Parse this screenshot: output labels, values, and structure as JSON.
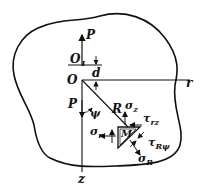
{
  "diagram": {
    "labels": {
      "P_top": "P",
      "O1": "O",
      "O1_sub": "1",
      "d": "d",
      "O": "O",
      "r_axis": "r",
      "P_bottom": "P",
      "psi": "ψ",
      "R": "R",
      "sigma_z": "σ",
      "sigma_z_sub": "z",
      "tau_rz": "τ",
      "tau_rz_sub": "rz",
      "sigma_r": "σ",
      "sigma_r_sub": "r",
      "M": "M",
      "tau_Rpsi": "τ",
      "tau_Rpsi_sub": "Rψ",
      "sigma_R": "σ",
      "sigma_R_sub": "R",
      "z_axis": "z"
    },
    "colors": {
      "stroke": "#111111",
      "background": "#ffffff"
    }
  }
}
